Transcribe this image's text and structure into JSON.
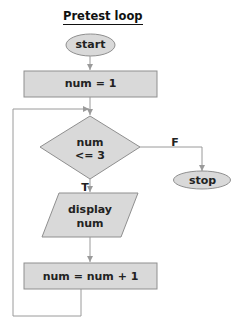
{
  "diagram": {
    "title": "Pretest loop",
    "colors": {
      "fill": "#d9d9d9",
      "stroke": "#8f8f8f",
      "arrow": "#9a9a9a",
      "text": "#222222"
    },
    "nodes": {
      "start": {
        "type": "terminator",
        "label": "start"
      },
      "init": {
        "type": "process",
        "label": "num = 1"
      },
      "condition": {
        "type": "decision",
        "line1": "num",
        "line2": "<= 3"
      },
      "output": {
        "type": "io",
        "line1": "display",
        "line2": "num"
      },
      "increment": {
        "type": "process",
        "label": "num = num + 1"
      },
      "stop": {
        "type": "terminator",
        "label": "stop"
      }
    },
    "edges": {
      "true_label": "T",
      "false_label": "F"
    }
  }
}
